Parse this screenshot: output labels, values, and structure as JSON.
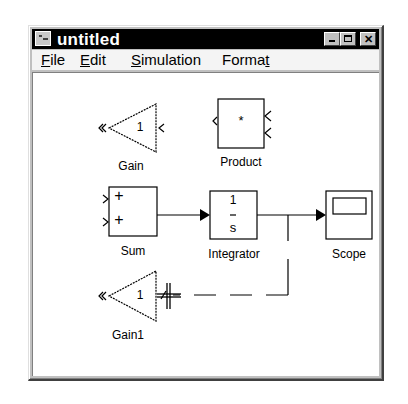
{
  "window": {
    "title": "untitled",
    "icon": "simulink-model-icon",
    "controls": [
      "minimize",
      "maximize",
      "close"
    ]
  },
  "menubar": {
    "items": [
      {
        "label": "File",
        "mnemonic": "F"
      },
      {
        "label": "Edit",
        "mnemonic": "E"
      },
      {
        "label": "Simulation",
        "mnemonic": "S"
      },
      {
        "label": "Format",
        "mnemonic": "t"
      }
    ]
  },
  "blocks": {
    "gain": {
      "label": "Gain",
      "value": "1"
    },
    "product": {
      "label": "Product",
      "symbol": "*"
    },
    "sum": {
      "label": "Sum",
      "signs": [
        "+",
        "+"
      ]
    },
    "integrator": {
      "label": "Integrator",
      "numerator": "1",
      "denominator": "s"
    },
    "scope": {
      "label": "Scope"
    },
    "gain1": {
      "label": "Gain1",
      "value": "1"
    }
  },
  "connections": [
    {
      "from": "Sum",
      "to": "Integrator",
      "state": "connected"
    },
    {
      "from": "Integrator",
      "to": "Scope",
      "state": "connected"
    },
    {
      "from": "Integrator-branch",
      "to": "Gain1",
      "state": "drawing"
    }
  ],
  "cursor": {
    "type": "crosshair-double"
  }
}
